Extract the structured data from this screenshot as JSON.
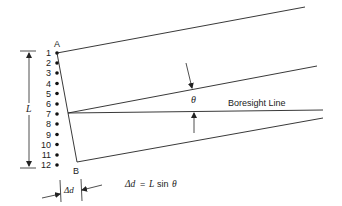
{
  "diagram": {
    "element_labels": [
      "1",
      "2",
      "3",
      "4",
      "5",
      "6",
      "7",
      "8",
      "9",
      "10",
      "11",
      "12"
    ],
    "end_a_label": "A",
    "end_b_label": "B",
    "aperture_label": "L",
    "angle_label": "θ",
    "boresight_label": "Boresight Line",
    "delta_d_label": "Δd",
    "equation": {
      "lhs": "Δd",
      "equals": "=",
      "L": "L",
      "sin": "sin",
      "theta": "θ"
    }
  }
}
